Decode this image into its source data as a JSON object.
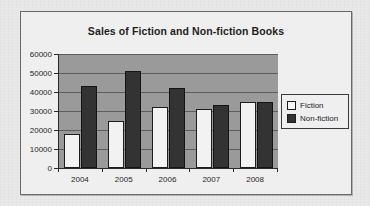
{
  "chart_data": {
    "type": "bar",
    "title": "Sales of Fiction and Non-fiction Books",
    "xlabel": "",
    "ylabel": "",
    "categories": [
      "2004",
      "2005",
      "2006",
      "2007",
      "2008"
    ],
    "series": [
      {
        "name": "Fiction",
        "values": [
          18000,
          25000,
          32000,
          31000,
          35000
        ]
      },
      {
        "name": "Non-fiction",
        "values": [
          43000,
          51000,
          42000,
          33000,
          35000
        ]
      }
    ],
    "ylim": [
      0,
      60000
    ],
    "y_ticks": [
      "0",
      "10000",
      "20000",
      "30000",
      "40000",
      "50000",
      "60000"
    ],
    "y_tick_values": [
      0,
      10000,
      20000,
      30000,
      40000,
      50000,
      60000
    ],
    "grid": true,
    "legend_position": "right",
    "colors": {
      "fiction": "#f2f2f2",
      "nonfiction": "#333333",
      "plot_background": "#9a9a9a",
      "gridline": "#5d5d5d",
      "axis": "#2a2a2a",
      "frame_background": "#efefef",
      "page_background": "#e9e9e9",
      "text": "#1e1e1e"
    }
  },
  "legend": {
    "items": [
      {
        "label": "Fiction",
        "swatch": "fiction"
      },
      {
        "label": "Non-fiction",
        "swatch": "nonfiction"
      }
    ]
  }
}
